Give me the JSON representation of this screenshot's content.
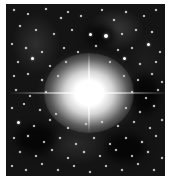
{
  "image": {
    "description": "Grayscale astronomical photograph of a very bright star with diffraction spikes surrounded by a dense star field and faint nebulosity",
    "frame": {
      "x": 6,
      "y": 4,
      "width": 159,
      "height": 172
    },
    "colors": {
      "background": "#ffffff",
      "sky": "#141414",
      "star": "#ffffff"
    },
    "bright_star": {
      "cx": 83,
      "cy": 89
    }
  },
  "dark_patches": [
    {
      "x": 80,
      "y": 20,
      "w": 30,
      "h": 22
    },
    {
      "x": 10,
      "y": 120,
      "w": 40,
      "h": 30
    },
    {
      "x": 100,
      "y": 130,
      "w": 40,
      "h": 28
    },
    {
      "x": 125,
      "y": 70,
      "w": 28,
      "h": 40
    }
  ],
  "stars": [
    [
      8,
      6,
      2
    ],
    [
      22,
      10,
      1.5
    ],
    [
      40,
      5,
      2
    ],
    [
      55,
      14,
      2.5
    ],
    [
      62,
      8,
      1.5
    ],
    [
      75,
      12,
      2
    ],
    [
      96,
      6,
      1.5
    ],
    [
      108,
      16,
      2
    ],
    [
      120,
      8,
      2.5
    ],
    [
      138,
      12,
      1.5
    ],
    [
      150,
      6,
      2
    ],
    [
      14,
      22,
      2
    ],
    [
      30,
      26,
      1.5
    ],
    [
      48,
      30,
      2
    ],
    [
      66,
      26,
      1.5
    ],
    [
      84,
      30,
      3
    ],
    [
      100,
      32,
      4
    ],
    [
      116,
      30,
      1.5
    ],
    [
      130,
      26,
      2
    ],
    [
      146,
      28,
      2.5
    ],
    [
      6,
      40,
      1.5
    ],
    [
      20,
      44,
      2.5
    ],
    [
      36,
      48,
      1.5
    ],
    [
      58,
      44,
      2
    ],
    [
      72,
      48,
      1.5
    ],
    [
      90,
      42,
      2
    ],
    [
      112,
      46,
      2
    ],
    [
      126,
      44,
      1.5
    ],
    [
      142,
      40,
      3
    ],
    [
      154,
      48,
      1.5
    ],
    [
      12,
      58,
      2
    ],
    [
      26,
      54,
      3
    ],
    [
      44,
      62,
      1.5
    ],
    [
      60,
      58,
      2
    ],
    [
      104,
      58,
      1.5
    ],
    [
      118,
      54,
      3
    ],
    [
      134,
      60,
      2
    ],
    [
      150,
      58,
      1.5
    ],
    [
      8,
      72,
      1.5
    ],
    [
      22,
      70,
      2
    ],
    [
      36,
      76,
      2.5
    ],
    [
      52,
      72,
      1.5
    ],
    [
      118,
      72,
      2
    ],
    [
      132,
      76,
      1.5
    ],
    [
      146,
      70,
      2
    ],
    [
      156,
      78,
      1.5
    ],
    [
      10,
      86,
      2
    ],
    [
      24,
      92,
      1.5
    ],
    [
      40,
      88,
      2
    ],
    [
      126,
      88,
      2.5
    ],
    [
      140,
      94,
      1.5
    ],
    [
      152,
      86,
      2
    ],
    [
      6,
      104,
      2
    ],
    [
      18,
      100,
      1.5
    ],
    [
      34,
      106,
      2
    ],
    [
      50,
      110,
      1.5
    ],
    [
      120,
      104,
      1.5
    ],
    [
      134,
      108,
      2
    ],
    [
      148,
      102,
      2.5
    ],
    [
      12,
      118,
      3
    ],
    [
      28,
      122,
      1.5
    ],
    [
      44,
      116,
      2
    ],
    [
      62,
      124,
      1.5
    ],
    [
      80,
      120,
      2
    ],
    [
      96,
      118,
      2.5
    ],
    [
      112,
      122,
      1.5
    ],
    [
      128,
      118,
      2
    ],
    [
      144,
      124,
      1.5
    ],
    [
      156,
      116,
      2
    ],
    [
      8,
      134,
      1.5
    ],
    [
      22,
      132,
      2.5
    ],
    [
      38,
      138,
      1.5
    ],
    [
      54,
      134,
      2
    ],
    [
      70,
      140,
      1.5
    ],
    [
      88,
      134,
      2
    ],
    [
      104,
      140,
      1.5
    ],
    [
      120,
      134,
      2
    ],
    [
      136,
      138,
      2.5
    ],
    [
      150,
      132,
      1.5
    ],
    [
      14,
      148,
      2
    ],
    [
      30,
      152,
      1.5
    ],
    [
      46,
      146,
      2
    ],
    [
      62,
      154,
      1.5
    ],
    [
      78,
      148,
      2.5
    ],
    [
      94,
      152,
      1.5
    ],
    [
      110,
      146,
      2
    ],
    [
      126,
      152,
      1.5
    ],
    [
      142,
      148,
      2.5
    ],
    [
      156,
      154,
      1.5
    ],
    [
      6,
      162,
      1.5
    ],
    [
      20,
      166,
      2
    ],
    [
      36,
      160,
      1.5
    ],
    [
      52,
      166,
      2
    ],
    [
      68,
      162,
      1.5
    ],
    [
      84,
      168,
      2
    ],
    [
      100,
      162,
      1.5
    ],
    [
      116,
      166,
      2
    ],
    [
      132,
      160,
      1.5
    ],
    [
      148,
      166,
      2
    ]
  ]
}
